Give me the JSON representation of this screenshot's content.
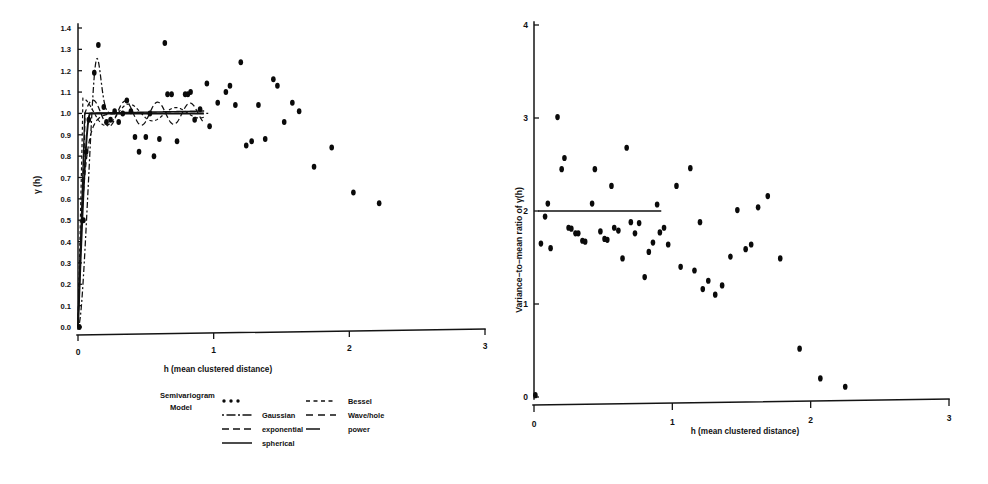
{
  "figure": {
    "panels": [
      "semivariogram",
      "variance-to-mean-ratio"
    ]
  },
  "chart_data": [
    {
      "id": "semivariogram",
      "type": "scatter",
      "title": "",
      "xlabel": "h (mean clustered distance)",
      "ylabel": "γ (h)",
      "xlim": [
        0,
        3
      ],
      "ylim": [
        0,
        1.4
      ],
      "xticks": [
        0,
        1,
        2,
        3
      ],
      "xticklabels": [
        "0",
        "1",
        "2",
        "3"
      ],
      "yticks": [
        0.0,
        0.1,
        0.2,
        0.3,
        0.4,
        0.5,
        0.6,
        0.7,
        0.8,
        0.9,
        1.0,
        1.1,
        1.2,
        1.3,
        1.4
      ],
      "yticklabels": [
        "0.0",
        "0.1",
        "0.2",
        "0.3",
        "0.4",
        "0.5",
        "0.6",
        "0.7",
        "0.8",
        "0.9",
        "1.0",
        "1.1",
        "1.2",
        "1.3",
        "1.4"
      ],
      "grid": false,
      "marker": "filled-circle",
      "points": [
        [
          0.01,
          0.0
        ],
        [
          0.04,
          0.5
        ],
        [
          0.06,
          0.82
        ],
        [
          0.08,
          0.97
        ],
        [
          0.12,
          1.19
        ],
        [
          0.15,
          1.32
        ],
        [
          0.19,
          1.03
        ],
        [
          0.21,
          0.96
        ],
        [
          0.24,
          0.97
        ],
        [
          0.27,
          1.01
        ],
        [
          0.3,
          0.96
        ],
        [
          0.33,
          1.0
        ],
        [
          0.36,
          1.06
        ],
        [
          0.39,
          1.01
        ],
        [
          0.42,
          0.89
        ],
        [
          0.45,
          0.82
        ],
        [
          0.5,
          0.89
        ],
        [
          0.53,
          1.0
        ],
        [
          0.56,
          0.8
        ],
        [
          0.6,
          0.88
        ],
        [
          0.64,
          1.33
        ],
        [
          0.66,
          1.09
        ],
        [
          0.69,
          1.09
        ],
        [
          0.73,
          0.87
        ],
        [
          0.79,
          1.09
        ],
        [
          0.81,
          1.09
        ],
        [
          0.83,
          1.1
        ],
        [
          0.86,
          0.97
        ],
        [
          0.9,
          1.02
        ],
        [
          0.95,
          1.14
        ],
        [
          0.97,
          0.94
        ],
        [
          1.03,
          1.05
        ],
        [
          1.09,
          1.1
        ],
        [
          1.12,
          1.13
        ],
        [
          1.16,
          1.04
        ],
        [
          1.2,
          1.24
        ],
        [
          1.24,
          0.85
        ],
        [
          1.28,
          0.87
        ],
        [
          1.33,
          1.04
        ],
        [
          1.38,
          0.88
        ],
        [
          1.44,
          1.16
        ],
        [
          1.47,
          1.13
        ],
        [
          1.52,
          0.96
        ],
        [
          1.58,
          1.05
        ],
        [
          1.63,
          1.01
        ],
        [
          1.74,
          0.75
        ],
        [
          1.87,
          0.84
        ],
        [
          2.03,
          0.63
        ],
        [
          2.22,
          0.58
        ]
      ],
      "models": [
        {
          "name": "Gaussian",
          "style": "dash-dot"
        },
        {
          "name": "exponential",
          "style": "dashed"
        },
        {
          "name": "spherical",
          "style": "solid"
        },
        {
          "name": "Bessel",
          "style": "dashed-short"
        },
        {
          "name": "Wave/hole",
          "style": "dashed-long"
        },
        {
          "name": "power",
          "style": "solid-short"
        }
      ],
      "legend": {
        "title_line1": "Semivariogram",
        "title_line2": "Model",
        "position": "below-axes",
        "entries": [
          {
            "label": "",
            "symbol": "dots"
          },
          {
            "label": "Gaussian",
            "symbol": "dash-dot"
          },
          {
            "label": "exponential",
            "symbol": "dashed"
          },
          {
            "label": "spherical",
            "symbol": "solid"
          },
          {
            "label": "Bessel",
            "symbol": "dashed-short"
          },
          {
            "label": "Wave/hole",
            "symbol": "dashed-long"
          },
          {
            "label": "power",
            "symbol": "solid-short"
          }
        ]
      }
    },
    {
      "id": "variance-to-mean-ratio",
      "type": "scatter",
      "title": "",
      "xlabel": "h (mean clustered distance)",
      "ylabel": "Variance−to−mean ratio of  γ(h)",
      "xlim": [
        0,
        3
      ],
      "ylim": [
        0,
        4
      ],
      "xticks": [
        0,
        1,
        2,
        3
      ],
      "xticklabels": [
        "0",
        "1",
        "2",
        "3"
      ],
      "yticks": [
        0,
        1,
        2,
        3,
        4
      ],
      "yticklabels": [
        "0",
        "1",
        "2",
        "3",
        "4"
      ],
      "grid": false,
      "marker": "filled-circle",
      "reference_line": {
        "y": 2.0,
        "x_start": 0.03,
        "x_end": 0.92
      },
      "points": [
        [
          0.01,
          0.02
        ],
        [
          0.05,
          1.65
        ],
        [
          0.08,
          1.94
        ],
        [
          0.1,
          2.08
        ],
        [
          0.12,
          1.6
        ],
        [
          0.17,
          3.01
        ],
        [
          0.2,
          2.45
        ],
        [
          0.22,
          2.57
        ],
        [
          0.25,
          1.82
        ],
        [
          0.27,
          1.81
        ],
        [
          0.3,
          1.76
        ],
        [
          0.32,
          1.76
        ],
        [
          0.35,
          1.68
        ],
        [
          0.37,
          1.67
        ],
        [
          0.42,
          2.08
        ],
        [
          0.44,
          2.45
        ],
        [
          0.48,
          1.78
        ],
        [
          0.51,
          1.7
        ],
        [
          0.53,
          1.69
        ],
        [
          0.56,
          2.27
        ],
        [
          0.58,
          1.82
        ],
        [
          0.61,
          1.79
        ],
        [
          0.64,
          1.49
        ],
        [
          0.67,
          2.68
        ],
        [
          0.7,
          1.88
        ],
        [
          0.73,
          1.76
        ],
        [
          0.76,
          1.87
        ],
        [
          0.8,
          1.29
        ],
        [
          0.83,
          1.56
        ],
        [
          0.86,
          1.66
        ],
        [
          0.89,
          2.07
        ],
        [
          0.91,
          1.77
        ],
        [
          0.94,
          1.82
        ],
        [
          0.97,
          1.64
        ],
        [
          1.03,
          2.27
        ],
        [
          1.06,
          1.4
        ],
        [
          1.13,
          2.46
        ],
        [
          1.16,
          1.36
        ],
        [
          1.2,
          1.88
        ],
        [
          1.22,
          1.16
        ],
        [
          1.26,
          1.25
        ],
        [
          1.31,
          1.1
        ],
        [
          1.36,
          1.2
        ],
        [
          1.42,
          1.51
        ],
        [
          1.47,
          2.01
        ],
        [
          1.53,
          1.59
        ],
        [
          1.57,
          1.64
        ],
        [
          1.62,
          2.04
        ],
        [
          1.69,
          2.16
        ],
        [
          1.78,
          1.49
        ],
        [
          1.92,
          0.52
        ],
        [
          2.07,
          0.2
        ],
        [
          2.25,
          0.11
        ]
      ]
    }
  ]
}
